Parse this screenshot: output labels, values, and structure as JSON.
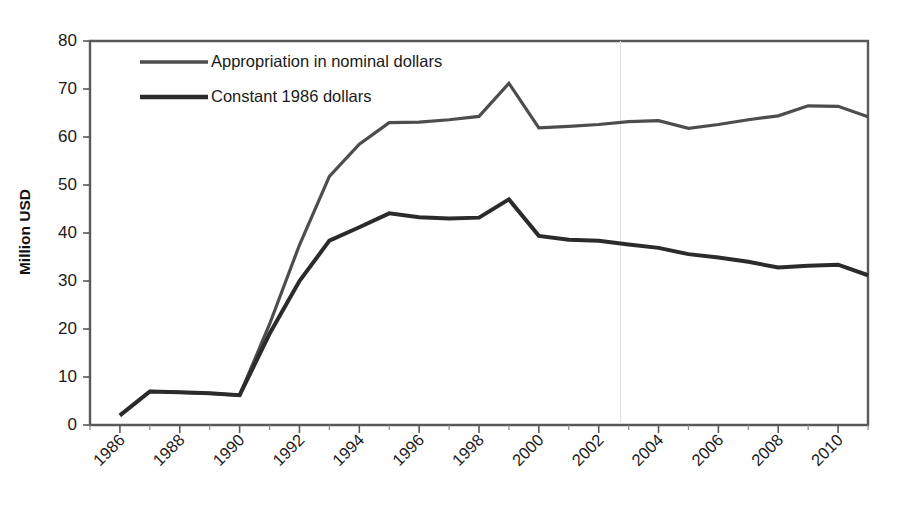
{
  "chart_data": {
    "type": "line",
    "title": "",
    "xlabel": "",
    "ylabel": "Million USD",
    "ylim": [
      0,
      80
    ],
    "ytick_step": 10,
    "yticks": [
      "0",
      "10",
      "20",
      "30",
      "40",
      "50",
      "60",
      "70",
      "80"
    ],
    "xlim": [
      1985,
      2011
    ],
    "x": [
      1986,
      1987,
      1988,
      1989,
      1990,
      1991,
      1992,
      1993,
      1994,
      1995,
      1996,
      1997,
      1998,
      1999,
      2000,
      2001,
      2002,
      2003,
      2004,
      2005,
      2006,
      2007,
      2008,
      2009,
      2010,
      2011
    ],
    "xticks": [
      "1986",
      "1988",
      "1990",
      "1992",
      "1994",
      "1996",
      "1998",
      "2000",
      "2002",
      "2004",
      "2006",
      "2008",
      "2010"
    ],
    "xtick_years": [
      1986,
      1988,
      1990,
      1992,
      1994,
      1996,
      1998,
      2000,
      2002,
      2004,
      2006,
      2008,
      2010
    ],
    "xtick_rotation": -45,
    "grid": false,
    "legend_position": "top-left-inside",
    "series": [
      {
        "name": "Appropriation in nominal dollars",
        "color": "#4d4d4d",
        "width": 3.2,
        "values": [
          2.0,
          7.0,
          6.8,
          6.6,
          6.2,
          21.0,
          37.5,
          51.8,
          58.5,
          63.0,
          63.1,
          63.6,
          64.3,
          71.2,
          61.9,
          62.2,
          62.6,
          63.2,
          63.4,
          61.8,
          62.6,
          63.6,
          64.4,
          66.5,
          66.4,
          64.2
        ]
      },
      {
        "name": "Constant 1986 dollars",
        "color": "#2b2b2b",
        "width": 4.0,
        "values": [
          2.0,
          7.0,
          6.8,
          6.6,
          6.2,
          19.0,
          30.0,
          38.4,
          41.2,
          44.1,
          43.3,
          43.0,
          43.2,
          47.0,
          39.4,
          38.6,
          38.4,
          37.6,
          36.9,
          35.6,
          34.9,
          34.0,
          32.8,
          33.2,
          33.4,
          31.2
        ]
      }
    ],
    "legend": [
      {
        "label": "Appropriation in nominal dollars",
        "color": "#4d4d4d",
        "width": 3.4
      },
      {
        "label": "Constant 1986 dollars",
        "color": "#2b2b2b",
        "width": 4.6
      }
    ],
    "colors": {
      "background": "#ffffff",
      "axis": "#595959",
      "text": "#1a1a1a",
      "nominal_series": "#4d4d4d",
      "constant_series": "#2b2b2b"
    }
  }
}
